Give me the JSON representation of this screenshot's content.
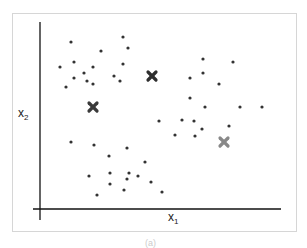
{
  "chart_data": {
    "type": "scatter",
    "title": "",
    "xlabel": "x1",
    "ylabel": "x2",
    "xlabel_main": "x",
    "xlabel_sub": "1",
    "ylabel_main": "x",
    "ylabel_sub": "2",
    "grid": false,
    "legend": null,
    "ticks": "none",
    "axis_pixel_frame": {
      "origin": [
        40,
        209
      ],
      "x_end": 281,
      "y_top": 22
    },
    "series": [
      {
        "name": "data points",
        "marker": "dot",
        "color": "#333333",
        "points": [
          [
            71,
            42
          ],
          [
            123,
            37
          ],
          [
            128,
            48
          ],
          [
            101,
            51
          ],
          [
            60,
            67
          ],
          [
            74,
            62
          ],
          [
            93,
            67
          ],
          [
            84,
            73
          ],
          [
            74,
            78
          ],
          [
            87,
            81
          ],
          [
            93,
            84
          ],
          [
            66,
            87
          ],
          [
            123,
            64
          ],
          [
            114,
            76
          ],
          [
            120,
            81
          ],
          [
            203,
            59
          ],
          [
            233,
            62
          ],
          [
            203,
            73
          ],
          [
            190,
            78
          ],
          [
            219,
            84
          ],
          [
            190,
            98
          ],
          [
            205,
            107
          ],
          [
            240,
            107
          ],
          [
            262,
            107
          ],
          [
            159,
            121
          ],
          [
            182,
            120
          ],
          [
            194,
            121
          ],
          [
            229,
            126
          ],
          [
            202,
            129
          ],
          [
            175,
            135
          ],
          [
            195,
            136
          ],
          [
            71,
            142
          ],
          [
            94,
            145
          ],
          [
            127,
            148
          ],
          [
            109,
            156
          ],
          [
            145,
            162
          ],
          [
            89,
            176
          ],
          [
            110,
            173
          ],
          [
            129,
            173
          ],
          [
            138,
            176
          ],
          [
            127,
            179
          ],
          [
            151,
            182
          ],
          [
            110,
            184
          ],
          [
            124,
            190
          ],
          [
            162,
            192
          ],
          [
            97,
            195
          ]
        ]
      },
      {
        "name": "centroids",
        "marker": "x",
        "points": [
          {
            "xy": [
              152,
              76
            ],
            "color": "#2e2e2e"
          },
          {
            "xy": [
              93,
              107
            ],
            "color": "#3a3a3a"
          },
          {
            "xy": [
              224,
              142
            ],
            "color": "#888888"
          }
        ]
      }
    ]
  },
  "caption": "(a)"
}
